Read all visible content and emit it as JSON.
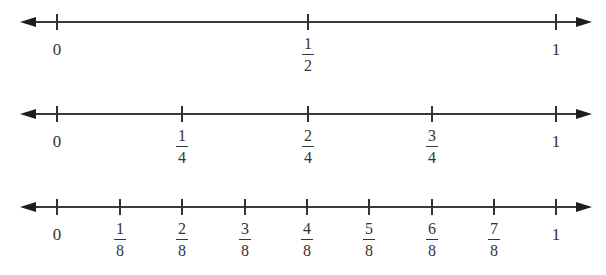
{
  "number_lines": [
    {
      "name": "halves",
      "y": 22,
      "ticks": [
        {
          "x": 57,
          "whole": "0"
        },
        {
          "x": 308,
          "num": "1",
          "den": "2"
        },
        {
          "x": 556,
          "whole": "1"
        }
      ]
    },
    {
      "name": "fourths",
      "y": 114,
      "ticks": [
        {
          "x": 57,
          "whole": "0"
        },
        {
          "x": 182,
          "num": "1",
          "den": "4"
        },
        {
          "x": 308,
          "num": "2",
          "den": "4"
        },
        {
          "x": 432,
          "num": "3",
          "den": "4"
        },
        {
          "x": 556,
          "whole": "1"
        }
      ]
    },
    {
      "name": "eighths",
      "y": 207,
      "ticks": [
        {
          "x": 57,
          "whole": "0"
        },
        {
          "x": 120,
          "num": "1",
          "den": "8"
        },
        {
          "x": 182,
          "num": "2",
          "den": "8"
        },
        {
          "x": 245,
          "num": "3",
          "den": "8"
        },
        {
          "x": 307,
          "num": "4",
          "den": "8"
        },
        {
          "x": 369,
          "num": "5",
          "den": "8"
        },
        {
          "x": 432,
          "num": "6",
          "den": "8"
        },
        {
          "x": 494,
          "num": "7",
          "den": "8"
        },
        {
          "x": 556,
          "whole": "1"
        }
      ]
    }
  ],
  "colors": {
    "line": "#3a3a3a",
    "text": "#333333",
    "background": "#ffffff"
  }
}
